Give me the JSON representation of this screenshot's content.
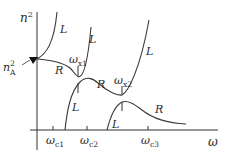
{
  "diagram": {
    "type": "dispersion-relation",
    "axes": {
      "y_label": "n",
      "y_label_sup": "2",
      "x_label": "ω"
    },
    "marker": {
      "label": "n",
      "label_sup": "2",
      "label_sub": "A"
    },
    "x_ticks": [
      {
        "label": "ω",
        "sub": "c1"
      },
      {
        "label": "ω",
        "sub": "c2"
      },
      {
        "label": "ω",
        "sub": "c3"
      }
    ],
    "crossover_labels": [
      {
        "label": "ω",
        "sub": "x1"
      },
      {
        "label": "ω",
        "sub": "x2"
      }
    ],
    "branch_labels": {
      "L1": "L",
      "L2": "L",
      "L3": "L",
      "L4": "L",
      "L5": "L",
      "R1": "R",
      "R2": "R",
      "R3": "R"
    }
  }
}
